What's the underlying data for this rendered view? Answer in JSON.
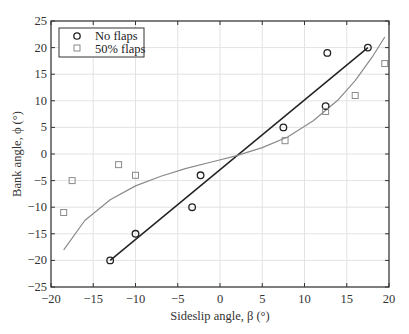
{
  "chart_data": {
    "type": "scatter",
    "title": "",
    "xlabel": "Sideslip angle, β (°)",
    "ylabel": "Bank angle, ϕ (°)",
    "xlim": [
      -20,
      20
    ],
    "ylim": [
      -25,
      25
    ],
    "xticks": [
      -20,
      -15,
      -10,
      -5,
      0,
      5,
      10,
      15,
      20
    ],
    "yticks": [
      -25,
      -20,
      -15,
      -10,
      -5,
      0,
      5,
      10,
      15,
      20,
      25
    ],
    "grid": true,
    "legend_position": "upper left",
    "series": [
      {
        "name": "No flaps",
        "marker": "circle",
        "color": "#222222",
        "points": [
          [
            -13,
            -20
          ],
          [
            -10,
            -15
          ],
          [
            -3.3,
            -10
          ],
          [
            -2.3,
            -4
          ],
          [
            7.5,
            5
          ],
          [
            12.5,
            9
          ],
          [
            12.7,
            19
          ],
          [
            17.5,
            20
          ]
        ],
        "fit": {
          "type": "linear",
          "color": "#222222",
          "points": [
            [
              -13,
              -20
            ],
            [
              17.5,
              20
            ]
          ]
        }
      },
      {
        "name": "50% flaps",
        "marker": "square",
        "color": "#8a8a8a",
        "points": [
          [
            -18.5,
            -11
          ],
          [
            -17.5,
            -5
          ],
          [
            -12,
            -2
          ],
          [
            -10,
            -4
          ],
          [
            7.7,
            2.5
          ],
          [
            12.5,
            8
          ],
          [
            16,
            11
          ],
          [
            19.5,
            17
          ]
        ],
        "fit": {
          "type": "cubic",
          "color": "#8a8a8a",
          "points": [
            [
              -18.5,
              -18
            ],
            [
              -16,
              -12.5
            ],
            [
              -13,
              -8.6
            ],
            [
              -10,
              -6
            ],
            [
              -7,
              -4.2
            ],
            [
              -4,
              -2.7
            ],
            [
              -1,
              -1.5
            ],
            [
              2,
              -0.3
            ],
            [
              3.2,
              0.3
            ],
            [
              5,
              1.2
            ],
            [
              8,
              3.2
            ],
            [
              11,
              6.2
            ],
            [
              14,
              10.2
            ],
            [
              16,
              13.8
            ],
            [
              18,
              18.2
            ],
            [
              19.5,
              22
            ]
          ]
        }
      }
    ]
  },
  "legend": {
    "items": [
      {
        "label": "No flaps"
      },
      {
        "label": "50% flaps"
      }
    ]
  },
  "axes": {
    "xlabel": "Sideslip angle, β (°)",
    "ylabel": "Bank angle, ϕ (°)"
  }
}
